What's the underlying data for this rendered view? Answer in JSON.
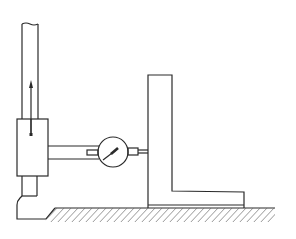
{
  "figure": {
    "title": "Checking a square with a height gauge and dial indicator",
    "type": "technical-line-drawing",
    "colors": {
      "line": "#2a2a2a",
      "hatch": "#6a6a6a",
      "background": "#ffffff"
    },
    "parts": [
      {
        "id": "height-gauge-column",
        "label": "Height gauge column"
      },
      {
        "id": "slider-block",
        "label": "Slider block"
      },
      {
        "id": "direction-arrow",
        "label": "Upward travel arrow"
      },
      {
        "id": "dial-indicator",
        "label": "Dial indicator"
      },
      {
        "id": "indicator-arm",
        "label": "Indicator arm"
      },
      {
        "id": "probe-stylus",
        "label": "Probe stylus"
      },
      {
        "id": "try-square",
        "label": "Square under test"
      },
      {
        "id": "surface-plate",
        "label": "Surface plate"
      }
    ]
  }
}
